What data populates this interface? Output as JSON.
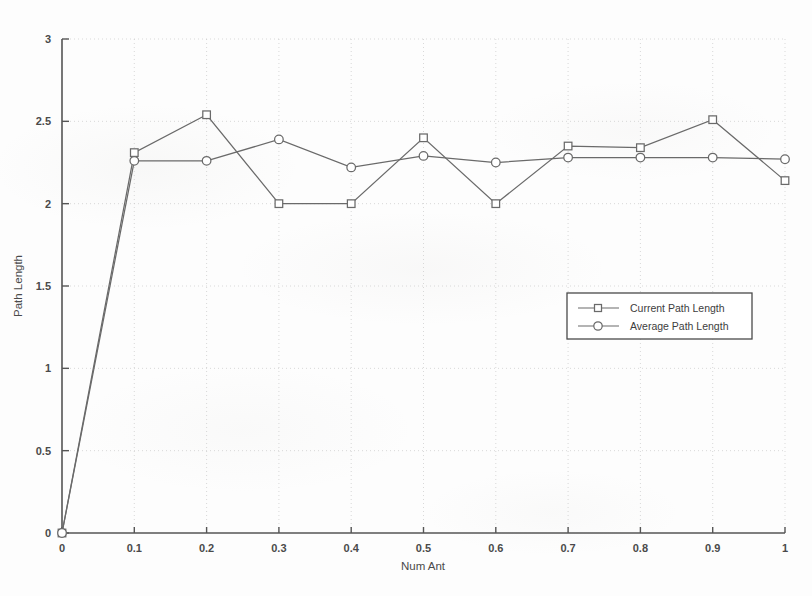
{
  "chart_data": {
    "type": "line",
    "title": "",
    "xlabel": "Num Ant",
    "ylabel": "Path Length",
    "xlim": [
      0,
      1
    ],
    "ylim": [
      0,
      3
    ],
    "grid": true,
    "legend_position": "center-right",
    "x": [
      0,
      0.1,
      0.2,
      0.3,
      0.4,
      0.5,
      0.6,
      0.7,
      0.8,
      0.9,
      1.0
    ],
    "xticks": [
      "0",
      "0.1",
      "0.2",
      "0.3",
      "0.4",
      "0.5",
      "0.6",
      "0.7",
      "0.8",
      "0.9",
      "1"
    ],
    "yticks": [
      "0",
      "0.5",
      "1",
      "1.5",
      "2",
      "2.5",
      "3"
    ],
    "ytick_values": [
      0,
      0.5,
      1,
      1.5,
      2,
      2.5,
      3
    ],
    "series": [
      {
        "name": "Current Path Length",
        "marker": "square",
        "color": "#6a6a6a",
        "values": [
          0,
          2.31,
          2.54,
          2.0,
          2.0,
          2.4,
          2.0,
          2.35,
          2.34,
          2.51,
          2.14
        ]
      },
      {
        "name": "Average Path Length",
        "marker": "circle",
        "color": "#6a6a6a",
        "values": [
          0,
          2.26,
          2.26,
          2.39,
          2.22,
          2.29,
          2.25,
          2.28,
          2.28,
          2.28,
          2.27
        ]
      }
    ]
  },
  "legend": {
    "entries": [
      {
        "label": "Current Path Length",
        "marker": "square-marker-icon"
      },
      {
        "label": "Average Path Length",
        "marker": "circle-marker-icon"
      }
    ]
  },
  "axes": {
    "x_title": "Num Ant",
    "y_title": "Path Length"
  }
}
